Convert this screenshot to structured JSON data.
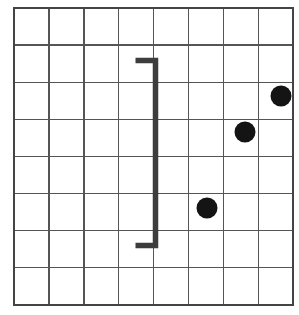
{
  "canvas": {
    "width": 299,
    "height": 315,
    "background_color": "#ffffff"
  },
  "grid": {
    "name": "8x8-square-grid",
    "columns": 8,
    "rows": 8,
    "left": 14,
    "top": 8,
    "cell_width": 34.9,
    "cell_height": 37.1,
    "line_color": "#555555",
    "line_width": 1.4,
    "border_color": "#444444",
    "border_width": 2.0
  },
  "shapes": {
    "bracket": {
      "name": "right-square-bracket",
      "symbol": "]",
      "color": "#3d3d3d",
      "stroke_width": 5.5,
      "vertical_x": 155.5,
      "top_y": 60.5,
      "bottom_y": 245.5,
      "arm_length": 20,
      "arm_direction": "left"
    },
    "dots": [
      {
        "name": "dot-top-right",
        "cx": 281,
        "cy": 96,
        "r": 10.5,
        "color": "#141414",
        "grid_col": 8,
        "grid_row": 3
      },
      {
        "name": "dot-middle",
        "cx": 245,
        "cy": 132,
        "r": 10.5,
        "color": "#141414",
        "grid_col": 7,
        "grid_row": 4
      },
      {
        "name": "dot-lower",
        "cx": 207,
        "cy": 208,
        "r": 10.5,
        "color": "#141414",
        "grid_col": 6,
        "grid_row": 6
      }
    ]
  }
}
